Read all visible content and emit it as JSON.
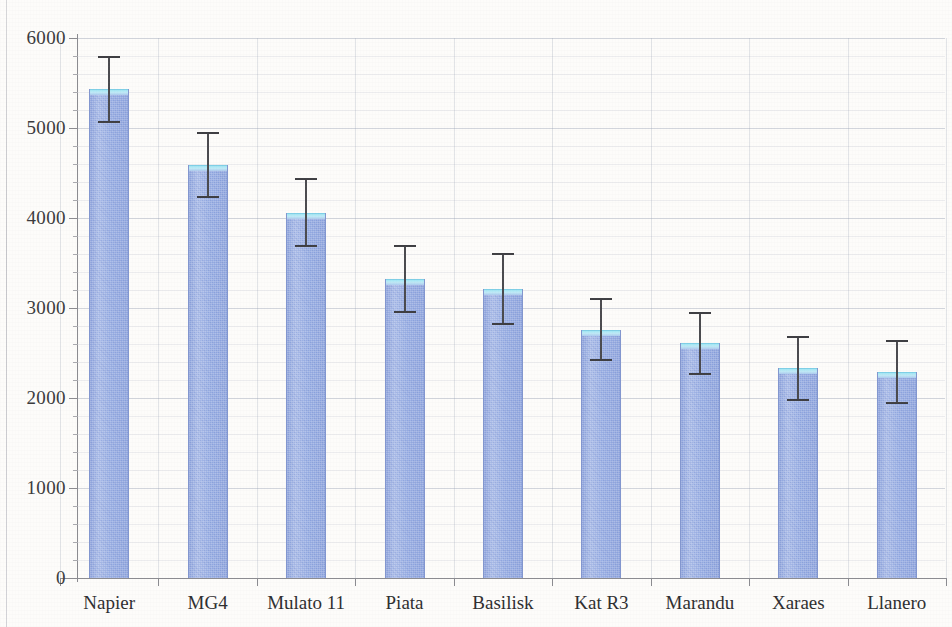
{
  "chart_data": {
    "type": "bar",
    "title": "",
    "xlabel": "",
    "ylabel": "",
    "ylim": [
      0,
      6000
    ],
    "ytick_values": [
      0,
      1000,
      2000,
      3000,
      4000,
      5000,
      6000
    ],
    "ytick_labels": [
      "0",
      "1000",
      "2000",
      "3000",
      "4000",
      "5000",
      "6000"
    ],
    "minor_tick_step": 200,
    "grid": true,
    "legend": false,
    "categories": [
      "Napier",
      "MG4",
      "Mulato 11",
      "Piata",
      "Basilisk",
      "Kat R3",
      "Marandu",
      "Xaraes",
      "Llanero"
    ],
    "values": [
      5430,
      4590,
      4060,
      3320,
      3210,
      2760,
      2610,
      2330,
      2290
    ],
    "errors": [
      370,
      370,
      380,
      380,
      400,
      350,
      350,
      360,
      360
    ],
    "bar_color": "#92a9e2",
    "bar_cap_color": "#9fe6f4",
    "error_bar_color": "#3e3e42",
    "axis_color": "#8b8b90",
    "grid_color": "#969eb2",
    "background_color": "#fdfcfa"
  },
  "axis": {
    "y_label_text": "",
    "x_label_text": ""
  }
}
